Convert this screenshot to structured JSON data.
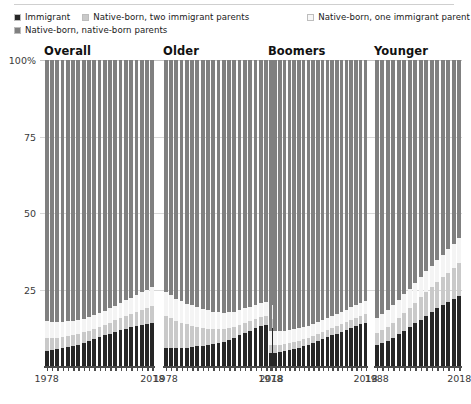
{
  "legend": {
    "items": [
      {
        "label": "Immigrant",
        "color": "#262626"
      },
      {
        "label": "Native-born, two immigrant parents",
        "color": "#c9c9c9"
      },
      {
        "label": "Native-born, one immigrant parent",
        "color": "#f4f4f4"
      },
      {
        "label": "Native-born, native-born parents",
        "color": "#808080"
      }
    ]
  },
  "chart_data": {
    "type": "bar",
    "subtype": "stacked-percent-small-multiples",
    "title": "",
    "xlabel": "",
    "ylabel": "",
    "ylim": [
      0,
      100
    ],
    "yticks": [
      "100%",
      "75",
      "50",
      "25"
    ],
    "ytick_values": [
      100,
      75,
      50,
      25
    ],
    "grid": true,
    "legend_position": "top",
    "series_names": [
      "Immigrant",
      "Native-born, two immigrant parents",
      "Native-born, one immigrant parent",
      "Native-born, native-born parents"
    ],
    "series_colors": [
      "#262626",
      "#c9c9c9",
      "#f4f4f4",
      "#808080"
    ],
    "panels": [
      {
        "title": "Overall",
        "xticks": [
          "1978",
          "2018"
        ],
        "xtick_values": [
          1978,
          2018
        ],
        "x": [
          1978,
          1980,
          1982,
          1984,
          1986,
          1988,
          1990,
          1992,
          1994,
          1996,
          1998,
          2000,
          2002,
          2004,
          2006,
          2008,
          2010,
          2012,
          2014,
          2016,
          2018
        ],
        "series": [
          {
            "name": "Immigrant",
            "values": [
              5.0,
              5.2,
              5.5,
              5.8,
              6.2,
              6.6,
              7.0,
              7.6,
              8.2,
              8.8,
              9.4,
              10.0,
              10.6,
              11.2,
              11.8,
              12.2,
              12.6,
              13.0,
              13.4,
              13.8,
              14.2
            ]
          },
          {
            "name": "Native-born, two immigrant parents",
            "values": [
              4.2,
              4.0,
              3.8,
              3.7,
              3.6,
              3.5,
              3.4,
              3.4,
              3.4,
              3.4,
              3.5,
              3.5,
              3.6,
              3.7,
              3.9,
              4.1,
              4.3,
              4.6,
              4.9,
              5.2,
              5.5
            ]
          },
          {
            "name": "Native-born, one immigrant parent",
            "values": [
              5.5,
              5.3,
              5.1,
              4.9,
              4.8,
              4.7,
              4.6,
              4.5,
              4.5,
              4.5,
              4.5,
              4.6,
              4.7,
              4.8,
              5.0,
              5.2,
              5.4,
              5.6,
              5.8,
              6.0,
              6.2
            ]
          },
          {
            "name": "Native-born, native-born parents",
            "values": [
              85.3,
              85.5,
              85.6,
              85.6,
              85.4,
              85.2,
              85.0,
              84.5,
              83.9,
              83.3,
              82.6,
              81.9,
              81.1,
              80.3,
              79.3,
              78.5,
              77.7,
              76.8,
              75.9,
              75.0,
              74.1
            ]
          }
        ]
      },
      {
        "title": "Older",
        "xticks": [
          "1978",
          "2018"
        ],
        "xtick_values": [
          1978,
          2018
        ],
        "x": [
          1978,
          1980,
          1982,
          1984,
          1986,
          1988,
          1990,
          1992,
          1994,
          1996,
          1998,
          2000,
          2002,
          2004,
          2006,
          2008,
          2010,
          2012,
          2014,
          2016,
          2018
        ],
        "series": [
          {
            "name": "Immigrant",
            "values": [
              6.0,
              5.9,
              5.8,
              5.8,
              6.0,
              6.2,
              6.4,
              6.6,
              6.9,
              7.2,
              7.6,
              8.0,
              8.6,
              9.2,
              10.0,
              10.8,
              11.6,
              12.4,
              13.0,
              13.4,
              12.4
            ]
          },
          {
            "name": "Native-born, two immigrant parents",
            "values": [
              10.5,
              9.8,
              9.0,
              8.3,
              7.6,
              7.0,
              6.4,
              5.8,
              5.3,
              4.8,
              4.4,
              4.0,
              3.7,
              3.5,
              3.3,
              3.2,
              3.1,
              3.0,
              3.0,
              3.0,
              3.0
            ]
          },
          {
            "name": "Native-born, one immigrant parent",
            "values": [
              7.8,
              7.5,
              7.2,
              7.0,
              6.8,
              6.6,
              6.4,
              6.2,
              6.0,
              5.8,
              5.6,
              5.4,
              5.2,
              5.0,
              4.9,
              4.8,
              4.7,
              4.6,
              4.6,
              4.6,
              4.6
            ]
          },
          {
            "name": "Native-born, native-born parents",
            "values": [
              75.7,
              76.8,
              78.0,
              78.9,
              79.6,
              80.2,
              80.8,
              81.4,
              81.8,
              82.2,
              82.4,
              82.6,
              82.5,
              82.3,
              81.8,
              81.2,
              80.6,
              80.0,
              79.4,
              79.0,
              80.0
            ]
          }
        ]
      },
      {
        "title": "Boomers",
        "xticks": [
          "1978",
          "2018"
        ],
        "xtick_values": [
          1978,
          2018
        ],
        "x": [
          1978,
          1980,
          1982,
          1984,
          1986,
          1988,
          1990,
          1992,
          1994,
          1996,
          1998,
          2000,
          2002,
          2004,
          2006,
          2008,
          2010,
          2012,
          2014,
          2016,
          2018
        ],
        "series": [
          {
            "name": "Immigrant",
            "values": [
              4.2,
              4.4,
              4.6,
              4.9,
              5.2,
              5.6,
              6.0,
              6.5,
              7.0,
              7.6,
              8.2,
              8.8,
              9.4,
              10.0,
              10.6,
              11.2,
              11.8,
              12.4,
              13.0,
              13.6,
              14.2
            ]
          },
          {
            "name": "Native-born, two immigrant parents",
            "values": [
              2.6,
              2.5,
              2.4,
              2.3,
              2.3,
              2.2,
              2.2,
              2.2,
              2.2,
              2.2,
              2.2,
              2.3,
              2.3,
              2.4,
              2.4,
              2.5,
              2.5,
              2.6,
              2.6,
              2.7,
              2.7
            ]
          },
          {
            "name": "Native-born, one immigrant parent",
            "values": [
              4.6,
              4.5,
              4.4,
              4.3,
              4.2,
              4.2,
              4.1,
              4.1,
              4.0,
              4.0,
              4.0,
              4.0,
              4.0,
              4.0,
              4.1,
              4.1,
              4.1,
              4.2,
              4.2,
              4.3,
              4.3
            ]
          },
          {
            "name": "Native-born, native-born parents",
            "values": [
              88.6,
              88.6,
              88.6,
              88.5,
              88.3,
              88.0,
              87.7,
              87.2,
              86.8,
              86.2,
              85.6,
              84.9,
              84.3,
              83.6,
              82.9,
              82.2,
              81.6,
              80.8,
              80.2,
              79.4,
              78.8
            ]
          }
        ]
      },
      {
        "title": "Younger",
        "xticks": [
          "1988",
          "2018"
        ],
        "xtick_values": [
          1988,
          2018
        ],
        "x": [
          1988,
          1990,
          1992,
          1994,
          1996,
          1998,
          2000,
          2002,
          2004,
          2006,
          2008,
          2010,
          2012,
          2014,
          2016,
          2018
        ],
        "series": [
          {
            "name": "Immigrant",
            "values": [
              6.8,
              7.4,
              8.2,
              9.2,
              10.4,
              11.6,
              12.8,
              14.0,
              15.2,
              16.4,
              17.6,
              18.8,
              19.8,
              20.8,
              21.8,
              23.0
            ]
          },
          {
            "name": "Native-born, two immigrant parents",
            "values": [
              4.0,
              4.3,
              4.6,
              5.0,
              5.4,
              5.8,
              6.2,
              6.7,
              7.2,
              7.7,
              8.2,
              8.7,
              9.2,
              9.7,
              10.2,
              10.7
            ]
          },
          {
            "name": "Native-born, one immigrant parent",
            "values": [
              5.0,
              5.2,
              5.4,
              5.6,
              5.8,
              6.0,
              6.2,
              6.4,
              6.6,
              6.8,
              7.0,
              7.2,
              7.4,
              7.6,
              7.8,
              8.0
            ]
          },
          {
            "name": "Native-born, native-born parents",
            "values": [
              84.2,
              83.1,
              81.8,
              80.2,
              78.4,
              76.6,
              74.8,
              72.9,
              71.0,
              69.1,
              67.2,
              65.3,
              63.6,
              61.9,
              60.2,
              58.3
            ]
          }
        ]
      }
    ]
  }
}
